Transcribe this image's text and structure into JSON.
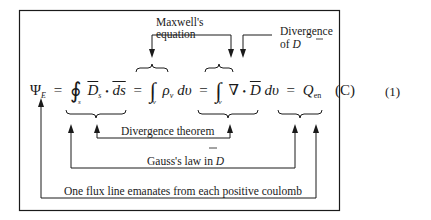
{
  "equation": {
    "number": "(1)",
    "lhs": "Ψ",
    "lhs_subscript": "E",
    "closed_integral": "∮",
    "closed_integral_limit": "s",
    "D_s": "D",
    "D_s_subscript": "s",
    "dot": "•",
    "ds": "ds",
    "eq": "=",
    "integral": "∫",
    "volume_limit": "v",
    "rho": "ρ",
    "rho_subscript": "v",
    "dv": "dυ",
    "nabla": "∇",
    "D": "D",
    "Q": "Q",
    "Q_subscript": "en",
    "unit": "(C)"
  },
  "annotations": {
    "maxwell": [
      "Maxwell's",
      "equation"
    ],
    "divergence": [
      "Divergence",
      "of"
    ],
    "divergence_symbol": "D",
    "divergence_theorem": "Divergence theorem",
    "gauss_law": "Gauss's law in",
    "gauss_law_symbol": "D",
    "flux_line": "One flux line emanates from each positive coulomb"
  },
  "colors": {
    "ink": "#1a1a1a",
    "background": "#ffffff"
  }
}
